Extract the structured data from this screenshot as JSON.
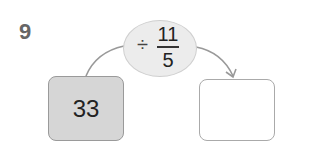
{
  "problem_number": "9",
  "operation": {
    "operator": "÷",
    "numerator": "11",
    "denominator": "5"
  },
  "start_value": "33",
  "answer_value": "",
  "colors": {
    "oval_fill": "#ececec",
    "start_box_fill": "#d6d6d6",
    "arrow": "#999999"
  }
}
